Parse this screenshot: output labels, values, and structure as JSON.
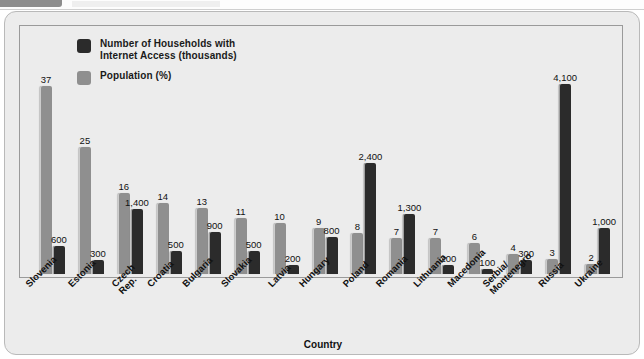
{
  "chrome": {
    "tab_label": "",
    "field_label": ""
  },
  "chart_data": {
    "type": "bar",
    "title": "",
    "xlabel": "Country",
    "ylabel": "",
    "grid": false,
    "legend_position": "top-left",
    "categories": [
      "Slovenia",
      "Estonia",
      "Czech Rep.",
      "Croatia",
      "Bulgaria",
      "Slovakia",
      "Latvia",
      "Hungary",
      "Poland",
      "Romania",
      "Lithuania",
      "Macedonia",
      "Serbia/\nMontenegro",
      "Russia",
      "Ukraine"
    ],
    "series": [
      {
        "name": "Population (%)",
        "color": "#8f8f8f",
        "values": [
          37,
          25,
          16,
          14,
          13,
          11,
          10,
          9,
          8,
          7,
          7,
          6,
          4,
          3,
          2
        ],
        "labels": [
          "37",
          "25",
          "16",
          "14",
          "13",
          "11",
          "10",
          "9",
          "8",
          "7",
          "7",
          "6",
          "4",
          "3",
          "2"
        ]
      },
      {
        "name": "Number of Households with Internet Access (thousands)",
        "color": "#2b2b2b",
        "values": [
          600,
          300,
          1400,
          500,
          900,
          500,
          200,
          800,
          2400,
          1300,
          200,
          100,
          300,
          4100,
          1000
        ],
        "labels": [
          "600",
          "300",
          "1,400",
          "500",
          "900",
          "500",
          "200",
          "800",
          "2,400",
          "1,300",
          "200",
          "100",
          "300",
          "4,100",
          "1,000"
        ]
      }
    ]
  },
  "legend": {
    "items": [
      {
        "label": "Number of Households with\nInternet Access (thousands)",
        "color": "#2b2b2b"
      },
      {
        "label": "Population (%)",
        "color": "#8f8f8f"
      }
    ]
  },
  "axis": {
    "x_title": "Country"
  },
  "colors": {
    "card_background": "#ececec",
    "population_bar": "#8f8f8f",
    "internet_bar": "#2b2b2b",
    "axis_line": "#767676",
    "text": "#111111"
  }
}
